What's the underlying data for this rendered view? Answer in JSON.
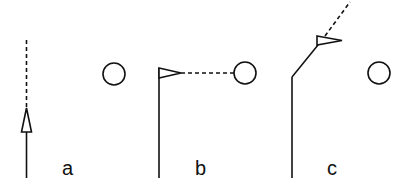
{
  "diagram": {
    "panels": [
      {
        "id": "a",
        "label": "a",
        "description": "Vertical trajectory with upward arrow and dashed continuation; circle to the right"
      },
      {
        "id": "b",
        "label": "b",
        "description": "Vertical trajectory ending in flag pointer aimed horizontally via dashed line at circle"
      },
      {
        "id": "c",
        "label": "c",
        "description": "Trajectory bending up-right, pointer with dashed line continuing away; circle to the right"
      }
    ],
    "colors": {
      "stroke": "#111111",
      "background": "#ffffff"
    }
  }
}
